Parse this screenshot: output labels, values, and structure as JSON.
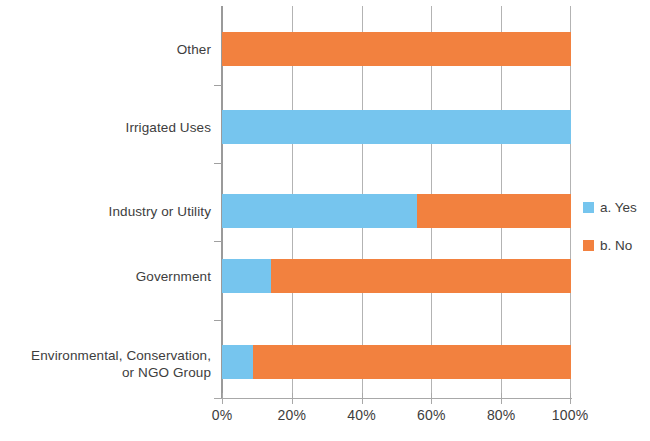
{
  "chart_data": {
    "type": "bar",
    "subtype": "stacked-horizontal-100pct",
    "title": "",
    "xlabel": "",
    "ylabel": "",
    "xlim": [
      0,
      100
    ],
    "xtick_labels": [
      "0%",
      "20%",
      "40%",
      "60%",
      "80%",
      "100%"
    ],
    "xtick_values": [
      0,
      20,
      40,
      60,
      80,
      100
    ],
    "grid": true,
    "grid_axis": "x",
    "legend_position": "right",
    "categories": [
      "Other",
      "Irrigated Uses",
      "Industry or Utility",
      "Government",
      "Environmental, Conservation, or NGO Group"
    ],
    "series": [
      {
        "name": "a. Yes",
        "color": "#76C5EE",
        "values": [
          0,
          100,
          56,
          14,
          9
        ]
      },
      {
        "name": "b. No",
        "color": "#F2813F",
        "values": [
          100,
          0,
          44,
          86,
          91
        ]
      }
    ]
  },
  "axis": {
    "categories": [
      {
        "line1": "Other",
        "line2": ""
      },
      {
        "line1": "Irrigated Uses",
        "line2": ""
      },
      {
        "line1": "Industry or Utility",
        "line2": ""
      },
      {
        "line1": "Government",
        "line2": ""
      },
      {
        "line1": "Environmental, Conservation,",
        "line2": "or NGO Group"
      }
    ],
    "xticks": [
      "0%",
      "20%",
      "40%",
      "60%",
      "80%",
      "100%"
    ]
  },
  "legend": {
    "items": [
      {
        "label": "a. Yes",
        "color": "#76C5EE",
        "swatch": "legend-swatch-yes"
      },
      {
        "label": "b. No",
        "color": "#F2813F",
        "swatch": "legend-swatch-no"
      }
    ]
  },
  "colors": {
    "yes": "#76C5EE",
    "no": "#F2813F",
    "grid": "#b3b3b3",
    "axis": "#9a9a9a",
    "text": "#3d3d3d",
    "background": "#ffffff"
  }
}
